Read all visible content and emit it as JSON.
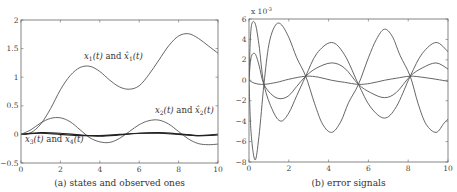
{
  "chart_data": [
    {
      "type": "line",
      "panel": "a",
      "caption": "(a) states and observed ones",
      "xlabel": "",
      "ylabel": "",
      "xlim": [
        0,
        10
      ],
      "ylim": [
        -0.5,
        2
      ],
      "xticks": [
        "0",
        "2",
        "4",
        "6",
        "8",
        "10"
      ],
      "yticks": [
        "-0.5",
        "0",
        "0.5",
        "1",
        "1.5",
        "2"
      ],
      "grid": false,
      "annotations": [
        {
          "text_main": "x1(t) and x̂1(t)",
          "x": 3.2,
          "y": 1.32
        },
        {
          "text_main": "x2(t) and x̂2(t)",
          "x": 6.8,
          "y": 0.38
        },
        {
          "text_main": "x3(t) and x4(t)",
          "x": 0.2,
          "y": -0.13
        }
      ],
      "series": [
        {
          "name": "x1(t) and x̂1(t)",
          "x": [
            0,
            0.5,
            1,
            1.5,
            2,
            2.5,
            3,
            3.5,
            4,
            4.5,
            5,
            5.5,
            6,
            6.5,
            7,
            7.5,
            8,
            8.5,
            9,
            9.5,
            10
          ],
          "values": [
            0,
            0.03,
            0.18,
            0.45,
            0.78,
            1.03,
            1.17,
            1.19,
            1.1,
            0.95,
            0.83,
            0.79,
            0.85,
            1.05,
            1.3,
            1.55,
            1.72,
            1.76,
            1.68,
            1.55,
            1.42
          ]
        },
        {
          "name": "x2(t) and x̂2(t)",
          "x": [
            0,
            0.5,
            1,
            1.5,
            2,
            2.5,
            3,
            3.5,
            4,
            4.5,
            5,
            5.5,
            6,
            6.5,
            7,
            7.5,
            8,
            8.5,
            9,
            9.5,
            10
          ],
          "values": [
            0,
            0.08,
            0.2,
            0.28,
            0.29,
            0.22,
            0.08,
            -0.06,
            -0.13,
            -0.14,
            -0.07,
            0.05,
            0.17,
            0.24,
            0.25,
            0.18,
            0.05,
            -0.08,
            -0.16,
            -0.18,
            -0.17
          ]
        },
        {
          "name": "x3(t)",
          "x": [
            0,
            1,
            2,
            3,
            4,
            5,
            6,
            7,
            8,
            9,
            10
          ],
          "values": [
            0,
            0.02,
            0.0,
            -0.02,
            -0.02,
            0.0,
            0.02,
            0.02,
            0.0,
            -0.02,
            0.0
          ]
        },
        {
          "name": "x4(t)",
          "x": [
            0,
            1,
            2,
            3,
            4,
            5,
            6,
            7,
            8,
            9,
            10
          ],
          "values": [
            0,
            0.03,
            0.02,
            -0.01,
            -0.03,
            -0.01,
            0.02,
            0.03,
            0.01,
            -0.02,
            -0.01
          ]
        }
      ]
    },
    {
      "type": "line",
      "panel": "b",
      "caption": "(b) error signals",
      "xlabel": "",
      "ylabel": "",
      "y_scale_label": "x 10",
      "y_scale_exponent": "-3",
      "xlim": [
        0,
        10
      ],
      "ylim": [
        -8,
        6
      ],
      "xticks": [
        "0",
        "2",
        "4",
        "6",
        "8",
        "10"
      ],
      "yticks": [
        "-8",
        "-6",
        "-4",
        "-2",
        "0",
        "2",
        "4",
        "6"
      ],
      "grid": false,
      "series": [
        {
          "name": "e1",
          "x": [
            0,
            0.1,
            0.3,
            0.5,
            0.75,
            1.0,
            1.3,
            1.6,
            2.0,
            2.4,
            2.85,
            3.3,
            3.7,
            4.15,
            4.6,
            5.0,
            5.5,
            6.0,
            6.4,
            6.8,
            7.2,
            7.6,
            8.1,
            8.5,
            8.9,
            9.4,
            9.8,
            10
          ],
          "values": [
            0,
            -5,
            -7.8,
            -5.5,
            -0.4,
            3.5,
            5.3,
            5.5,
            4.2,
            2.2,
            0.4,
            -2.3,
            -4.3,
            -5.1,
            -4.1,
            -2.2,
            -0.4,
            2.2,
            4.0,
            5.0,
            4.3,
            2.4,
            0.4,
            -2.3,
            -4.3,
            -5.1,
            -4.2,
            -3.8
          ]
        },
        {
          "name": "e2",
          "x": [
            0,
            0.1,
            0.3,
            0.5,
            0.75,
            1.2,
            1.6,
            2.0,
            2.4,
            2.85,
            3.4,
            4.15,
            4.8,
            5.5,
            6.1,
            6.8,
            7.4,
            8.1,
            8.7,
            9.4,
            10
          ],
          "values": [
            0,
            5,
            5.6,
            3.5,
            -0.4,
            -3.0,
            -4.0,
            -3.2,
            -1.5,
            0.4,
            2.6,
            3.7,
            2.5,
            -0.4,
            -2.6,
            -3.7,
            -2.6,
            0.4,
            2.6,
            3.7,
            2.8
          ]
        },
        {
          "name": "e3",
          "x": [
            0,
            0.1,
            0.3,
            0.5,
            0.75,
            1.2,
            1.6,
            2.0,
            2.4,
            2.85,
            3.4,
            4.15,
            4.8,
            5.5,
            6.1,
            6.8,
            7.4,
            8.1,
            8.7,
            9.4,
            10
          ],
          "values": [
            0,
            2.2,
            2.6,
            1.5,
            -0.4,
            -1.5,
            -1.8,
            -1.5,
            -0.6,
            0.4,
            1.2,
            1.7,
            1.2,
            -0.4,
            -1.2,
            -1.7,
            -1.2,
            0.4,
            1.2,
            1.7,
            1.1
          ]
        },
        {
          "name": "e4",
          "x": [
            0,
            0.3,
            0.75,
            1.4,
            2.0,
            2.85,
            3.5,
            4.15,
            4.8,
            5.5,
            6.1,
            6.8,
            7.4,
            8.1,
            8.7,
            9.4,
            10
          ],
          "values": [
            0,
            -0.3,
            -0.4,
            -0.2,
            0.1,
            0.4,
            0.3,
            0.0,
            -0.2,
            -0.4,
            -0.3,
            0.0,
            0.2,
            0.4,
            0.3,
            0.1,
            -0.1
          ]
        }
      ]
    }
  ]
}
